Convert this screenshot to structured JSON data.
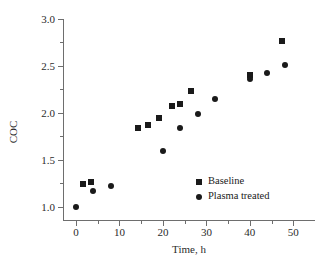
{
  "chart_data": {
    "type": "scatter",
    "title": "",
    "xlabel": "Time, h",
    "ylabel": "COC",
    "xlim": [
      -3,
      55
    ],
    "ylim": [
      0.85,
      3.0
    ],
    "grid": false,
    "legend_position": "lower-right-inside",
    "x_ticks": [
      0,
      10,
      20,
      30,
      40,
      50
    ],
    "x_tick_labels": [
      "0",
      "10",
      "20",
      "30",
      "40",
      "50"
    ],
    "x_minor_ticks": [
      5,
      15,
      25,
      35,
      45
    ],
    "y_ticks": [
      1.0,
      1.5,
      2.0,
      2.5,
      3.0
    ],
    "y_tick_labels": [
      "1.0",
      "1.5",
      "2.0",
      "2.5",
      "3.0"
    ],
    "y_minor_ticks": [
      1.25,
      1.75,
      2.25,
      2.75
    ],
    "series": [
      {
        "name": "Baseline",
        "marker": "square",
        "color": "#1a1a1a",
        "points": [
          {
            "x": 1.5,
            "y": 1.24
          },
          {
            "x": 3.5,
            "y": 1.27
          },
          {
            "x": 14.2,
            "y": 1.84
          },
          {
            "x": 16.5,
            "y": 1.87
          },
          {
            "x": 19.0,
            "y": 1.95
          },
          {
            "x": 22.0,
            "y": 2.07
          },
          {
            "x": 24.0,
            "y": 2.09
          },
          {
            "x": 26.5,
            "y": 2.23
          },
          {
            "x": 40.0,
            "y": 2.4
          },
          {
            "x": 47.5,
            "y": 2.77
          }
        ]
      },
      {
        "name": "Plasma treated",
        "marker": "circle",
        "color": "#1a1a1a",
        "points": [
          {
            "x": 0.0,
            "y": 1.0
          },
          {
            "x": 4.0,
            "y": 1.17
          },
          {
            "x": 8.0,
            "y": 1.22
          },
          {
            "x": 20.0,
            "y": 1.6
          },
          {
            "x": 24.0,
            "y": 1.84
          },
          {
            "x": 28.0,
            "y": 1.99
          },
          {
            "x": 32.0,
            "y": 2.15
          },
          {
            "x": 40.0,
            "y": 2.36
          },
          {
            "x": 44.0,
            "y": 2.42
          },
          {
            "x": 48.0,
            "y": 2.51
          }
        ]
      }
    ]
  },
  "legend": {
    "items": [
      {
        "label": "Baseline",
        "marker": "square"
      },
      {
        "label": "Plasma treated",
        "marker": "circle"
      }
    ]
  }
}
